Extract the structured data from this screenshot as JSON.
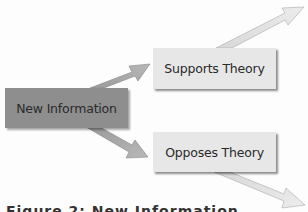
{
  "diagram": {
    "nodes": [
      {
        "id": "new",
        "label": "New Information",
        "color": "#8e8e8e"
      },
      {
        "id": "sup",
        "label": "Supports Theory",
        "color": "#e7e7e7"
      },
      {
        "id": "opp",
        "label": "Opposes Theory",
        "color": "#e7e7e7"
      }
    ],
    "edges": [
      {
        "from": "new",
        "to": "sup"
      },
      {
        "from": "new",
        "to": "opp"
      },
      {
        "from": "sup",
        "to": "top-right"
      },
      {
        "from": "opp",
        "to": "bottom-right"
      }
    ],
    "caption": "Figure 2: New Information"
  }
}
